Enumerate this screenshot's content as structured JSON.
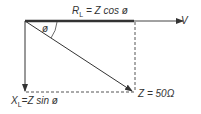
{
  "diagram": {
    "type": "impedance phasor diagram",
    "labels": {
      "resistance": {
        "symbol": "R",
        "sub": "L",
        "eq": " = Z cos ø"
      },
      "reactance": {
        "symbol": "X",
        "sub": "L",
        "eq": "=Z  sin  ø"
      },
      "impedance": "Z = 50Ω",
      "voltage": "V",
      "angle": "ø"
    },
    "colors": {
      "line": "#333333",
      "dashed": "#555555",
      "background": "#ffffff"
    }
  }
}
